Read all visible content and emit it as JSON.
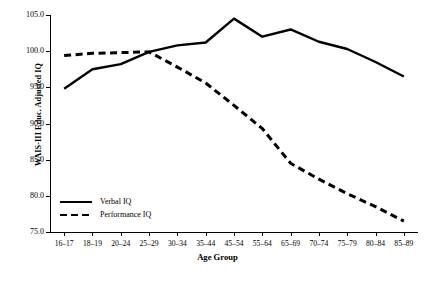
{
  "chart_data": {
    "type": "line",
    "title": "",
    "xlabel": "Age Group",
    "ylabel": "WAIS-III Educ. Adjusted IQ",
    "categories": [
      "16–17",
      "18–19",
      "20–24",
      "25–29",
      "30–34",
      "35–44",
      "45–54",
      "55–64",
      "65–69",
      "70–74",
      "75–79",
      "80–84",
      "85–89"
    ],
    "ylim": [
      75.0,
      105.0
    ],
    "yticks": [
      75.0,
      80.0,
      85.0,
      90.0,
      95.0,
      100.0,
      105.0
    ],
    "ytick_labels": [
      "75.0",
      "80.0",
      "85.0",
      "90.0",
      "95.0",
      "100.0",
      "105.0"
    ],
    "grid": false,
    "legend_position": "lower-left-inside",
    "series": [
      {
        "name": "Verbal IQ",
        "style": "solid",
        "color": "#000000",
        "values": [
          94.8,
          97.5,
          98.2,
          99.9,
          100.8,
          101.2,
          104.5,
          102.0,
          103.0,
          101.3,
          100.3,
          98.5,
          96.5
        ]
      },
      {
        "name": "Performance IQ",
        "style": "dashed",
        "color": "#000000",
        "values": [
          99.4,
          99.7,
          99.8,
          99.9,
          97.8,
          95.6,
          92.5,
          89.3,
          84.5,
          82.3,
          80.3,
          78.5,
          76.5
        ]
      }
    ]
  },
  "legend": {
    "items": [
      {
        "label": "Verbal IQ",
        "style": "solid"
      },
      {
        "label": "Performance IQ",
        "style": "dashed"
      }
    ]
  }
}
